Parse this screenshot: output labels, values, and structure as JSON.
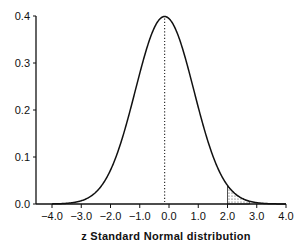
{
  "chart_data": {
    "type": "line",
    "title": "",
    "xlabel": "z Standard Normal distribution",
    "ylabel": "",
    "xlim": [
      -4.0,
      4.0
    ],
    "ylim": [
      0.0,
      0.4
    ],
    "x_ticks": [
      "-4.0",
      "-3.0",
      "-2.0",
      "-1.0",
      "0.0",
      "1.0",
      "2.0",
      "3.0",
      "4.0"
    ],
    "y_ticks": [
      "0.0",
      "0.1",
      "0.2",
      "0.3",
      "0.4"
    ],
    "grid": false,
    "legend": null,
    "series": [
      {
        "name": "Standard normal density",
        "x": [
          -4.0,
          -3.5,
          -3.0,
          -2.5,
          -2.0,
          -1.5,
          -1.0,
          -0.5,
          0.0,
          0.5,
          1.0,
          1.5,
          2.0,
          2.5,
          3.0,
          3.5,
          4.0
        ],
        "values": [
          0.0001,
          0.0009,
          0.0044,
          0.0175,
          0.054,
          0.1295,
          0.242,
          0.3521,
          0.3989,
          0.3521,
          0.242,
          0.1295,
          0.054,
          0.0175,
          0.0044,
          0.0009,
          0.0001
        ]
      }
    ],
    "annotations": [
      {
        "type": "vertical-dotted-line",
        "x": 0.0,
        "label": "mean"
      },
      {
        "type": "shaded-area",
        "x_from": 2.0,
        "x_to": 4.0,
        "label": "upper tail area beyond z = 2.0"
      }
    ]
  }
}
